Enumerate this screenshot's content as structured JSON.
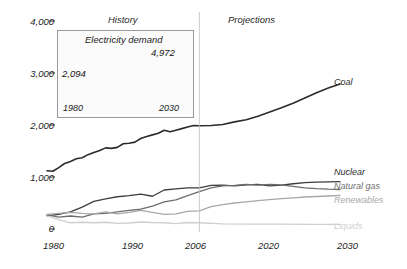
{
  "chart_data": {
    "type": "line",
    "title": "",
    "xlabel": "",
    "ylabel": "",
    "xlim": [
      1980,
      2030
    ],
    "ylim": [
      0,
      4000
    ],
    "grid": false,
    "legend_position": "right-inline",
    "y_ticks": [
      "0",
      "1,000",
      "2,000",
      "3,000",
      "4,000"
    ],
    "y_tick_values": [
      0,
      1000,
      2000,
      3000,
      4000
    ],
    "x_ticks": [
      "1980",
      "1990",
      "2006",
      "2020",
      "2030"
    ],
    "x_tick_values": [
      1980,
      1990,
      2006,
      2020,
      2030
    ],
    "annotations": {
      "history": "History",
      "projections": "Projections",
      "divider_year": 2006
    },
    "series": [
      {
        "name": "Coal",
        "color": "#2b2b2b",
        "width": 1.6,
        "label_x": 2031,
        "label_y": 2790,
        "x": [
          1980,
          1981,
          1982,
          1983,
          1984,
          1985,
          1986,
          1987,
          1988,
          1989,
          1990,
          1991,
          1992,
          1993,
          1994,
          1995,
          1996,
          1997,
          1998,
          1999,
          2000,
          2001,
          2002,
          2003,
          2004,
          2005,
          2006,
          2008,
          2010,
          2012,
          2014,
          2016,
          2018,
          2020,
          2022,
          2024,
          2026,
          2028,
          2030
        ],
        "y": [
          1120,
          1110,
          1180,
          1260,
          1300,
          1350,
          1370,
          1430,
          1470,
          1510,
          1560,
          1550,
          1570,
          1640,
          1650,
          1670,
          1740,
          1780,
          1810,
          1840,
          1900,
          1870,
          1900,
          1930,
          1960,
          1990,
          1985,
          1990,
          2010,
          2060,
          2100,
          2170,
          2250,
          2330,
          2420,
          2520,
          2620,
          2710,
          2790
        ]
      },
      {
        "name": "Nuclear",
        "color": "#3d3d3d",
        "width": 1.3,
        "label_x": 2031,
        "label_y": 930,
        "x": [
          1980,
          1982,
          1984,
          1986,
          1988,
          1990,
          1992,
          1994,
          1996,
          1998,
          2000,
          2002,
          2004,
          2006,
          2008,
          2010,
          2012,
          2014,
          2016,
          2018,
          2020,
          2022,
          2024,
          2026,
          2028,
          2030
        ],
        "y": [
          255,
          280,
          330,
          420,
          530,
          580,
          620,
          640,
          670,
          630,
          750,
          770,
          790,
          790,
          840,
          845,
          830,
          850,
          860,
          830,
          845,
          870,
          890,
          900,
          905,
          910
        ]
      },
      {
        "name": "Natural gas",
        "color": "#6d6d6d",
        "width": 1.3,
        "label_x": 2031,
        "label_y": 770,
        "x": [
          1980,
          1982,
          1984,
          1986,
          1988,
          1990,
          1992,
          1994,
          1996,
          1998,
          2000,
          2002,
          2004,
          2006,
          2008,
          2010,
          2012,
          2014,
          2016,
          2018,
          2020,
          2022,
          2024,
          2026,
          2028,
          2030
        ],
        "y": [
          270,
          230,
          250,
          230,
          290,
          300,
          330,
          360,
          380,
          440,
          520,
          560,
          640,
          720,
          790,
          830,
          840,
          860,
          845,
          860,
          850,
          820,
          790,
          775,
          765,
          760
        ]
      },
      {
        "name": "Renewables",
        "color": "#a8a8a8",
        "width": 1.3,
        "label_x": 2031,
        "label_y": 640,
        "x": [
          1980,
          1982,
          1984,
          1986,
          1988,
          1990,
          1992,
          1994,
          1996,
          1998,
          2000,
          2002,
          2004,
          2006,
          2008,
          2010,
          2012,
          2014,
          2016,
          2018,
          2020,
          2022,
          2024,
          2026,
          2028,
          2030
        ],
        "y": [
          280,
          300,
          320,
          300,
          290,
          330,
          290,
          320,
          360,
          320,
          280,
          290,
          340,
          350,
          430,
          470,
          500,
          520,
          545,
          565,
          585,
          600,
          615,
          625,
          635,
          645
        ]
      },
      {
        "name": "Liquids",
        "color": "#cfcfcf",
        "width": 1.3,
        "label_x": 2031,
        "label_y": 95,
        "x": [
          1980,
          1982,
          1984,
          1986,
          1988,
          1990,
          1992,
          1994,
          1996,
          1998,
          2000,
          2002,
          2004,
          2006,
          2010,
          2015,
          2020,
          2025,
          2030
        ],
        "y": [
          250,
          180,
          120,
          130,
          120,
          130,
          110,
          115,
          135,
          125,
          120,
          105,
          125,
          120,
          100,
          95,
          92,
          90,
          88
        ]
      }
    ],
    "inset": {
      "title": "Electricity demand",
      "type": "line",
      "x": [
        1980,
        2030
      ],
      "y": [
        2094,
        4972
      ],
      "point_labels": [
        "2,094",
        "4,972"
      ],
      "x_ticks": [
        "1980",
        "2030"
      ],
      "marker": "filled-circle"
    }
  }
}
